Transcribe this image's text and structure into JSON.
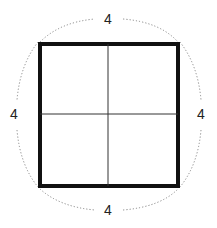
{
  "diagram": {
    "title": "",
    "square": {
      "side_label": "4",
      "divided_into": 4
    },
    "labels": {
      "top": "4",
      "left": "4",
      "right": "4",
      "bottom": "4"
    },
    "colors": {
      "outline": "#111111",
      "divider": "#333333",
      "dotted_arc": "#888888"
    }
  }
}
